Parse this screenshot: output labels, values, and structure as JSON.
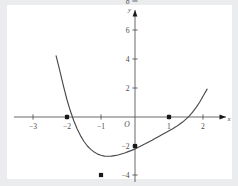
{
  "figure": {
    "background_color": "#ffffff",
    "border_color": "#ebecee",
    "axis_color": "#58585a",
    "curve_color": "#4a4a4c",
    "point_color": "#1a1a1a"
  },
  "chart_data": {
    "type": "line",
    "title": "",
    "subtitle": "",
    "xlabel": "x",
    "ylabel": "y",
    "grid": false,
    "legend": null,
    "origin_label": "O",
    "xlim": [
      -3.6,
      2.6
    ],
    "ylim": [
      -4.6,
      9.2
    ],
    "x_ticks": [
      -3,
      -2,
      -1,
      1,
      2
    ],
    "x_tick_labels": [
      "−3",
      "−2",
      "−1",
      "1",
      "2"
    ],
    "y_ticks": [
      2,
      4,
      6,
      8,
      -2,
      -4
    ],
    "y_tick_labels": [
      "2",
      "4",
      "6",
      "8",
      "−2",
      "−4"
    ],
    "function": "f(x) = −(x + 2)(x − 1)²",
    "x_domain_drawn": [
      -2.32,
      2.12
    ],
    "annotations": [],
    "marked_points": [
      {
        "label": "(−2, 0)",
        "x": -2,
        "y": 0,
        "kind": "x-intercept"
      },
      {
        "label": "(−1, −4)",
        "x": -1,
        "y": -4,
        "kind": "local-minimum"
      },
      {
        "label": "(0, −2)",
        "x": 0,
        "y": -2,
        "kind": "y-intercept"
      },
      {
        "label": "(1, 0)",
        "x": 1,
        "y": 0,
        "kind": "local-maximum"
      }
    ],
    "x": [
      -2.32,
      -2.2,
      -2.1,
      -2.0,
      -1.9,
      -1.8,
      -1.7,
      -1.6,
      -1.5,
      -1.4,
      -1.3,
      -1.2,
      -1.1,
      -1.0,
      -0.9,
      -0.8,
      -0.7,
      -0.6,
      -0.5,
      -0.4,
      -0.3,
      -0.2,
      -0.1,
      0.0,
      0.1,
      0.2,
      0.3,
      0.4,
      0.5,
      0.6,
      0.7,
      0.8,
      0.9,
      1.0,
      1.1,
      1.2,
      1.3,
      1.4,
      1.5,
      1.6,
      1.7,
      1.8,
      1.9,
      2.0,
      2.12
    ],
    "y": [
      4.22,
      3.07,
      2.09,
      1.19,
      0.41,
      -0.26,
      -0.83,
      -1.3,
      -1.69,
      -2.0,
      -2.23,
      -2.42,
      -2.56,
      -2.64,
      -2.7,
      -2.71,
      -2.7,
      -2.66,
      -2.62,
      -2.55,
      -2.48,
      -2.39,
      -2.3,
      -2.2,
      -2.09,
      -1.97,
      -1.85,
      -1.72,
      -1.6,
      -1.47,
      -1.34,
      -1.21,
      -1.08,
      -0.95,
      -0.82,
      -0.68,
      -0.52,
      -0.35,
      -0.15,
      0.08,
      0.35,
      0.66,
      1.02,
      1.43,
      1.92
    ]
  }
}
